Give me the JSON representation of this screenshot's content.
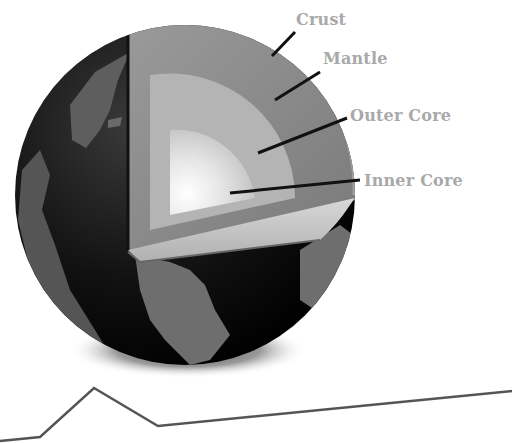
{
  "diagram": {
    "labels": [
      {
        "id": "crust",
        "text": "Crust"
      },
      {
        "id": "mantle",
        "text": "Mantle"
      },
      {
        "id": "outer_core",
        "text": "Outer Core"
      },
      {
        "id": "inner_core",
        "text": "Inner Core"
      }
    ],
    "colors": {
      "label_text": "#a9a9a9",
      "arrow": "#111111",
      "globe_dark": "#0a0a0a",
      "land": "#6e6e6e",
      "mantle": "#8c8c8c",
      "outer_core": "#b4b4b4",
      "inner_core": "#f2f2f2",
      "ground_line": "#555555"
    }
  }
}
